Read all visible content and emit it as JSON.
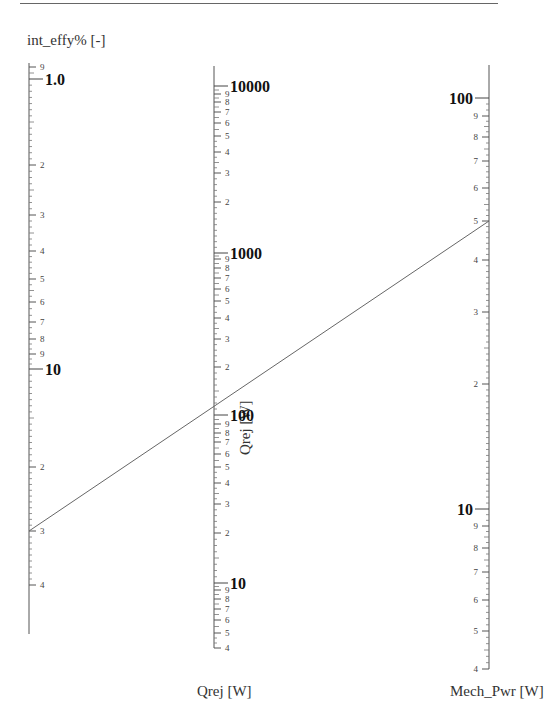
{
  "chart_data": {
    "type": "nomogram",
    "title": "",
    "axes": [
      {
        "name": "int_effy% [-]",
        "scale": "log",
        "x": 29,
        "y_top": 63,
        "y_bottom": 634,
        "major_labels": [
          {
            "text": "1.0",
            "value": 1.0,
            "y": 79,
            "bold": true
          },
          {
            "text": "10",
            "value": 10,
            "y": 369,
            "bold": true
          }
        ],
        "minor_labels": [
          {
            "text": "9",
            "value": 0.9,
            "y": 67
          },
          {
            "text": "2",
            "value": 2,
            "y": 165
          },
          {
            "text": "3",
            "value": 3,
            "y": 215
          },
          {
            "text": "4",
            "value": 4,
            "y": 251
          },
          {
            "text": "5",
            "value": 5,
            "y": 279
          },
          {
            "text": "6",
            "value": 6,
            "y": 302
          },
          {
            "text": "7",
            "value": 7,
            "y": 322
          },
          {
            "text": "8",
            "value": 8,
            "y": 339
          },
          {
            "text": "9",
            "value": 9,
            "y": 354
          },
          {
            "text": "2",
            "value": 20,
            "y": 467
          },
          {
            "text": "3",
            "value": 30,
            "y": 531
          },
          {
            "text": "4",
            "value": 40,
            "y": 585
          }
        ],
        "label_side": "right"
      },
      {
        "name": "Qrej [W]",
        "scale": "log",
        "x": 214,
        "y_top": 66,
        "y_bottom": 648,
        "major_labels": [
          {
            "text": "10000",
            "value": 10000,
            "y": 86,
            "bold": true
          },
          {
            "text": "1000",
            "value": 1000,
            "y": 253,
            "bold": true
          },
          {
            "text": "100",
            "value": 100,
            "y": 415,
            "bold": true
          },
          {
            "text": "10",
            "value": 10,
            "y": 583,
            "bold": true
          }
        ],
        "minor_labels": [
          {
            "text": "9",
            "value": 9000,
            "y": 94
          },
          {
            "text": "8",
            "value": 8000,
            "y": 102
          },
          {
            "text": "7",
            "value": 7000,
            "y": 112
          },
          {
            "text": "6",
            "value": 6000,
            "y": 123
          },
          {
            "text": "5",
            "value": 5000,
            "y": 136
          },
          {
            "text": "4",
            "value": 4000,
            "y": 152
          },
          {
            "text": "3",
            "value": 3000,
            "y": 173
          },
          {
            "text": "2",
            "value": 2000,
            "y": 202
          },
          {
            "text": "9",
            "value": 900,
            "y": 259
          },
          {
            "text": "8",
            "value": 800,
            "y": 268
          },
          {
            "text": "7",
            "value": 700,
            "y": 278
          },
          {
            "text": "6",
            "value": 600,
            "y": 289
          },
          {
            "text": "5",
            "value": 500,
            "y": 301
          },
          {
            "text": "4",
            "value": 400,
            "y": 318
          },
          {
            "text": "3",
            "value": 300,
            "y": 339
          },
          {
            "text": "2",
            "value": 200,
            "y": 367
          },
          {
            "text": "9",
            "value": 90,
            "y": 424
          },
          {
            "text": "8",
            "value": 80,
            "y": 433
          },
          {
            "text": "7",
            "value": 70,
            "y": 442
          },
          {
            "text": "6",
            "value": 60,
            "y": 454
          },
          {
            "text": "5",
            "value": 50,
            "y": 467
          },
          {
            "text": "4",
            "value": 40,
            "y": 483
          },
          {
            "text": "3",
            "value": 30,
            "y": 504
          },
          {
            "text": "2",
            "value": 20,
            "y": 533
          },
          {
            "text": "9",
            "value": 9,
            "y": 590
          },
          {
            "text": "8",
            "value": 8,
            "y": 599
          },
          {
            "text": "7",
            "value": 7,
            "y": 609
          },
          {
            "text": "6",
            "value": 6,
            "y": 620
          },
          {
            "text": "5",
            "value": 5,
            "y": 633
          },
          {
            "text": "4",
            "value": 4,
            "y": 648
          }
        ],
        "label_side": "right",
        "side_title": "Qrej [W]"
      },
      {
        "name": "Mech_Pwr [W]",
        "scale": "log",
        "x": 489,
        "y_top": 65,
        "y_bottom": 669,
        "major_labels": [
          {
            "text": "100",
            "value": 100,
            "y": 98,
            "bold": true
          },
          {
            "text": "10",
            "value": 10,
            "y": 509,
            "bold": true
          }
        ],
        "minor_labels": [
          {
            "text": "9",
            "value": 90,
            "y": 116
          },
          {
            "text": "8",
            "value": 80,
            "y": 137
          },
          {
            "text": "7",
            "value": 70,
            "y": 161
          },
          {
            "text": "6",
            "value": 60,
            "y": 188
          },
          {
            "text": "5",
            "value": 50,
            "y": 221
          },
          {
            "text": "4",
            "value": 40,
            "y": 260
          },
          {
            "text": "3",
            "value": 30,
            "y": 312
          },
          {
            "text": "2",
            "value": 20,
            "y": 384
          },
          {
            "text": "9",
            "value": 9,
            "y": 526
          },
          {
            "text": "8",
            "value": 8,
            "y": 548
          },
          {
            "text": "7",
            "value": 7,
            "y": 572
          },
          {
            "text": "6",
            "value": 6,
            "y": 600
          },
          {
            "text": "5",
            "value": 5,
            "y": 631
          },
          {
            "text": "4",
            "value": 4,
            "y": 669
          }
        ],
        "label_side": "left"
      }
    ],
    "isopleth": {
      "points": [
        {
          "axis": "int_effy% [-]",
          "value": 30,
          "x": 29,
          "y": 531
        },
        {
          "axis": "Qrej [W]",
          "value": 130,
          "x": 214,
          "y": 404
        },
        {
          "axis": "Mech_Pwr [W]",
          "value": 50,
          "x": 489,
          "y": 221
        }
      ]
    },
    "xlabel": "",
    "ylabel": "",
    "grid": false
  },
  "labels": {
    "left_axis_title": "int_effy% [-]",
    "middle_axis_bottom_title": "Qrej [W]",
    "middle_axis_side_title": "Qrej [W]",
    "right_axis_bottom_title": "Mech_Pwr [W]"
  }
}
